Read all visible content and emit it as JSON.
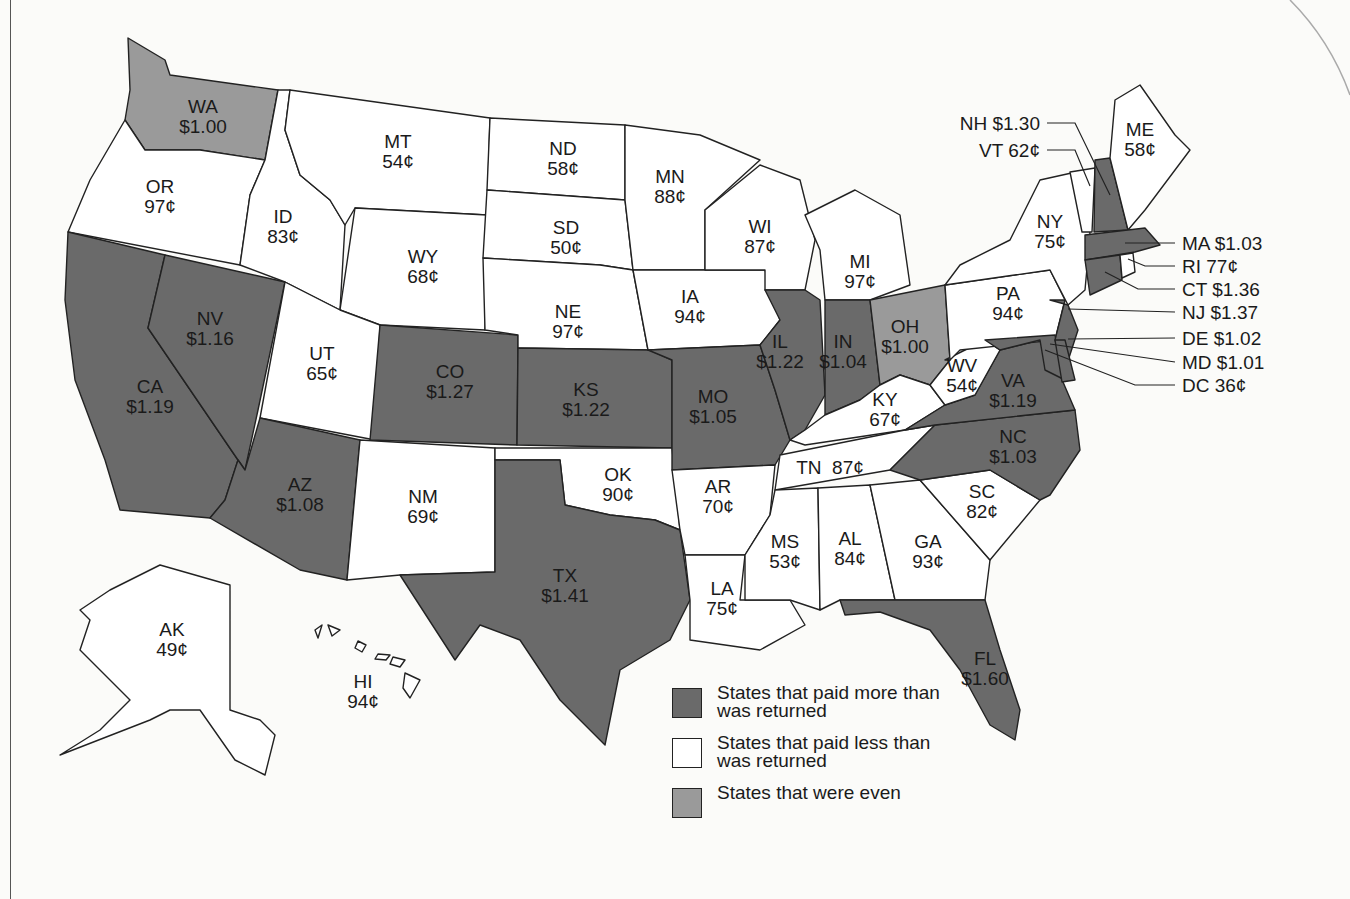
{
  "legend": {
    "items": [
      {
        "key": "more",
        "label": "States that paid more than was returned",
        "color": "#6a6a6a"
      },
      {
        "key": "less",
        "label": "States that paid less than was returned",
        "color": "#ffffff"
      },
      {
        "key": "even",
        "label": "States that were even",
        "color": "#9a9a9a"
      }
    ]
  },
  "states": {
    "WA": {
      "abbr": "WA",
      "value": "$1.00",
      "category": "even"
    },
    "OR": {
      "abbr": "OR",
      "value": "97¢",
      "category": "less"
    },
    "CA": {
      "abbr": "CA",
      "value": "$1.19",
      "category": "more"
    },
    "NV": {
      "abbr": "NV",
      "value": "$1.16",
      "category": "more"
    },
    "ID": {
      "abbr": "ID",
      "value": "83¢",
      "category": "less"
    },
    "MT": {
      "abbr": "MT",
      "value": "54¢",
      "category": "less"
    },
    "WY": {
      "abbr": "WY",
      "value": "68¢",
      "category": "less"
    },
    "UT": {
      "abbr": "UT",
      "value": "65¢",
      "category": "less"
    },
    "AZ": {
      "abbr": "AZ",
      "value": "$1.08",
      "category": "more"
    },
    "CO": {
      "abbr": "CO",
      "value": "$1.27",
      "category": "more"
    },
    "NM": {
      "abbr": "NM",
      "value": "69¢",
      "category": "less"
    },
    "ND": {
      "abbr": "ND",
      "value": "58¢",
      "category": "less"
    },
    "SD": {
      "abbr": "SD",
      "value": "50¢",
      "category": "less"
    },
    "NE": {
      "abbr": "NE",
      "value": "97¢",
      "category": "less"
    },
    "KS": {
      "abbr": "KS",
      "value": "$1.22",
      "category": "more"
    },
    "OK": {
      "abbr": "OK",
      "value": "90¢",
      "category": "less"
    },
    "TX": {
      "abbr": "TX",
      "value": "$1.41",
      "category": "more"
    },
    "MN": {
      "abbr": "MN",
      "value": "88¢",
      "category": "less"
    },
    "IA": {
      "abbr": "IA",
      "value": "94¢",
      "category": "less"
    },
    "MO": {
      "abbr": "MO",
      "value": "$1.05",
      "category": "more"
    },
    "AR": {
      "abbr": "AR",
      "value": "70¢",
      "category": "less"
    },
    "LA": {
      "abbr": "LA",
      "value": "75¢",
      "category": "less"
    },
    "WI": {
      "abbr": "WI",
      "value": "87¢",
      "category": "less"
    },
    "IL": {
      "abbr": "IL",
      "value": "$1.22",
      "category": "more"
    },
    "MI": {
      "abbr": "MI",
      "value": "97¢",
      "category": "less"
    },
    "IN": {
      "abbr": "IN",
      "value": "$1.04",
      "category": "more"
    },
    "OH": {
      "abbr": "OH",
      "value": "$1.00",
      "category": "even"
    },
    "KY": {
      "abbr": "KY",
      "value": "67¢",
      "category": "less"
    },
    "TN": {
      "abbr": "TN",
      "value": "87¢",
      "category": "less"
    },
    "MS": {
      "abbr": "MS",
      "value": "53¢",
      "category": "less"
    },
    "AL": {
      "abbr": "AL",
      "value": "84¢",
      "category": "less"
    },
    "GA": {
      "abbr": "GA",
      "value": "93¢",
      "category": "less"
    },
    "FL": {
      "abbr": "FL",
      "value": "$1.60",
      "category": "more"
    },
    "SC": {
      "abbr": "SC",
      "value": "82¢",
      "category": "less"
    },
    "NC": {
      "abbr": "NC",
      "value": "$1.03",
      "category": "more"
    },
    "VA": {
      "abbr": "VA",
      "value": "$1.19",
      "category": "more"
    },
    "WV": {
      "abbr": "WV",
      "value": "54¢",
      "category": "less"
    },
    "PA": {
      "abbr": "PA",
      "value": "94¢",
      "category": "less"
    },
    "NY": {
      "abbr": "NY",
      "value": "75¢",
      "category": "less"
    },
    "ME": {
      "abbr": "ME",
      "value": "58¢",
      "category": "less"
    },
    "AK": {
      "abbr": "AK",
      "value": "49¢",
      "category": "less"
    },
    "HI": {
      "abbr": "HI",
      "value": "94¢",
      "category": "less"
    }
  },
  "callouts": {
    "NH": "NH $1.30",
    "VT": "VT 62¢",
    "MA": "MA $1.03",
    "RI": "RI 77¢",
    "CT": "CT $1.36",
    "NJ": "NJ $1.37",
    "DE": "DE $1.02",
    "MD": "MD $1.01",
    "DC": "DC 36¢"
  },
  "TN_label": "TN  87¢"
}
